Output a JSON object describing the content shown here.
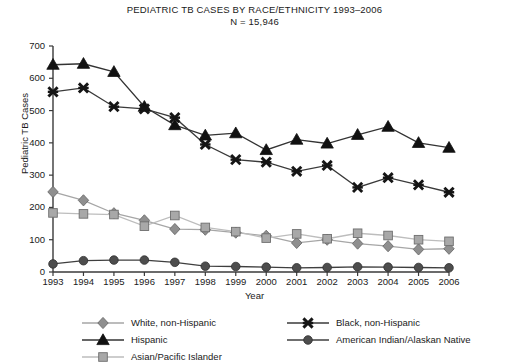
{
  "chart_data": {
    "type": "line",
    "title": "PEDIATRIC TB CASES BY RACE/ETHNICITY 1993–2006",
    "subtitle": "N = 15,946",
    "xlabel": "Year",
    "ylabel": "Pediatric TB Cases",
    "categories": [
      "1993",
      "1994",
      "1995",
      "1996",
      "1997",
      "1998",
      "1999",
      "2000",
      "2001",
      "2002",
      "2003",
      "2004",
      "2005",
      "2006"
    ],
    "x": [
      1993,
      1994,
      1995,
      1996,
      1997,
      1998,
      1999,
      2000,
      2001,
      2002,
      2003,
      2004,
      2005,
      2006
    ],
    "ylim": [
      0,
      700
    ],
    "yticks": [
      0,
      100,
      200,
      300,
      400,
      500,
      600,
      700
    ],
    "grid": false,
    "legend_position": "bottom",
    "series": [
      {
        "name": "White, non-Hispanic",
        "marker": "diamond",
        "color": "#8f8f8f",
        "line_color": "#a6a6a6",
        "values": [
          248,
          222,
          182,
          160,
          133,
          131,
          122,
          112,
          90,
          100,
          88,
          80,
          70,
          72
        ]
      },
      {
        "name": "Hispanic",
        "marker": "triangle",
        "color": "#111111",
        "line_color": "#333333",
        "values": [
          642,
          645,
          620,
          512,
          455,
          423,
          430,
          378,
          410,
          398,
          425,
          450,
          400,
          385
        ]
      },
      {
        "name": "Asian/Pacific Islander",
        "marker": "square",
        "color": "#a8a8a8",
        "line_color": "#bdbdbd",
        "values": [
          183,
          180,
          178,
          142,
          175,
          138,
          125,
          105,
          118,
          103,
          120,
          113,
          100,
          95
        ]
      },
      {
        "name": "Black, non-Hispanic",
        "marker": "cross",
        "color": "#151515",
        "line_color": "#3a3a3a",
        "values": [
          558,
          570,
          512,
          505,
          478,
          395,
          348,
          340,
          312,
          330,
          262,
          292,
          270,
          247
        ]
      },
      {
        "name": "American Indian/Alaskan Native",
        "marker": "circle",
        "color": "#4d4d4d",
        "line_color": "#3f3f3f",
        "values": [
          25,
          35,
          37,
          37,
          30,
          18,
          17,
          15,
          13,
          14,
          16,
          15,
          14,
          13
        ]
      }
    ]
  },
  "legend": {
    "columns": [
      {
        "items": [
          "White, non-Hispanic",
          "Hispanic",
          "Asian/Pacific Islander"
        ]
      },
      {
        "items": [
          "Black, non-Hispanic",
          "American Indian/Alaskan Native"
        ]
      }
    ]
  }
}
